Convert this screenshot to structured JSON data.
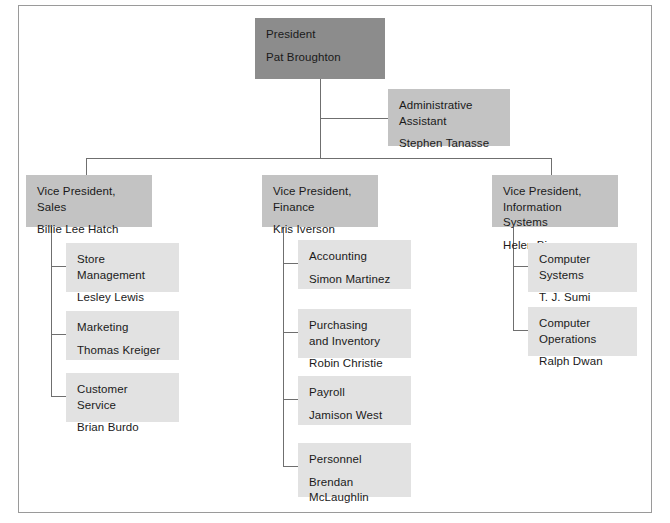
{
  "document": {
    "kind": "organization-chart",
    "colors": {
      "president_fill": "#8c8c8c",
      "vp_fill": "#c3c3c3",
      "assistant_fill": "#c3c3c3",
      "department_fill": "#e2e2e2",
      "connector": "#6f6f6f",
      "frame_border": "#9a9a9a",
      "page_background": "#ffffff",
      "text": "#1a1a1a"
    }
  },
  "nodes": {
    "president": {
      "title": "President",
      "person": "Pat Broughton"
    },
    "assistant": {
      "title": "Administrative\nAssistant",
      "person": "Stephen Tanasse"
    },
    "vp_sales": {
      "title": "Vice President,\nSales",
      "person": "Billie Lee Hatch"
    },
    "vp_finance": {
      "title": "Vice President,\nFinance",
      "person": "Kris Iverson"
    },
    "vp_is": {
      "title": "Vice President,\nInformation Systems",
      "person": "Helen Bjornson"
    },
    "sales_departments": [
      {
        "title": "Store\nManagement",
        "person": "Lesley Lewis"
      },
      {
        "title": "Marketing",
        "person": "Thomas Kreiger"
      },
      {
        "title": "Customer\nService",
        "person": "Brian Burdo"
      }
    ],
    "finance_departments": [
      {
        "title": "Accounting",
        "person": "Simon Martinez"
      },
      {
        "title": "Purchasing\nand Inventory",
        "person": "Robin Christie"
      },
      {
        "title": "Payroll",
        "person": "Jamison West"
      },
      {
        "title": "Personnel",
        "person": "Brendan\nMcLaughlin"
      }
    ],
    "is_departments": [
      {
        "title": "Computer\nSystems",
        "person": "T. J. Sumi"
      },
      {
        "title": "Computer\nOperations",
        "person": "Ralph Dwan"
      }
    ]
  }
}
